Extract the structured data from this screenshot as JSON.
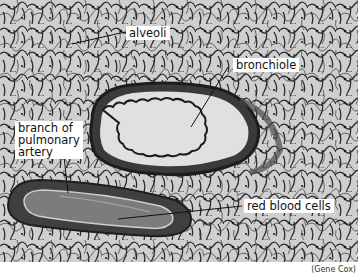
{
  "figure": {
    "type": "labeled micrograph",
    "labels": [
      {
        "id": "alveoli",
        "text": "alveoli"
      },
      {
        "id": "bronchiole",
        "text": "bronchiole"
      },
      {
        "id": "artery",
        "text": "branch of\npulmonary\nartery"
      },
      {
        "id": "rbc",
        "text": "red blood cells"
      }
    ],
    "credit": "(Gene Cox)"
  },
  "colors": {
    "background_tissue": "#c9c9c9",
    "tissue_walls": "#2a2a2a",
    "bronchiole_lumen": "#e2e2e2",
    "artery_wall": "#4a4a4a",
    "artery_lumen": "#7a7a7a",
    "label_bg": "#ffffff"
  }
}
